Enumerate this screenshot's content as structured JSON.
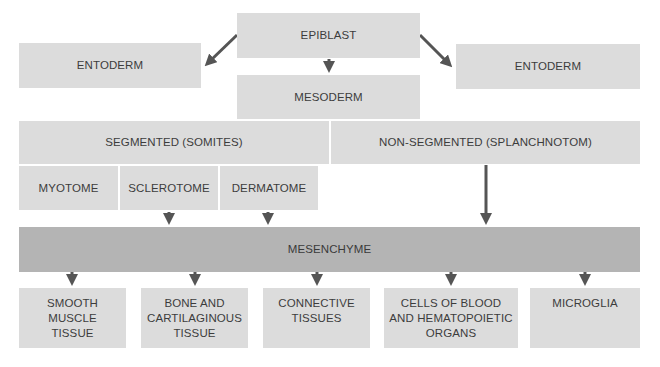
{
  "diagram": {
    "epiblast": "EPIBLAST",
    "entoderm_left": "ENTODERM",
    "entoderm_right": "ENTODERM",
    "mesoderm": "MESODERM",
    "segmented": "SEGMENTED (SOMITES)",
    "non_segmented": "NON-SEGMENTED (SPLANCHNOTOM)",
    "myotome": "MYOTOME",
    "sclerotome": "SCLEROTOME",
    "dermatome": "DERMATOME",
    "mesenchyme": "MESENCHYME",
    "outputs": [
      "SMOOTH\nMUSCLE\nTISSUE",
      "BONE AND\nCARTILAGINOUS\nTISSUE",
      "CONNECTIVE\nTISSUES",
      "CELLS OF BLOOD\nAND HEMATOPOIETIC\nORGANS",
      "MICROGLIA"
    ],
    "colors": {
      "box": "#dcdcdc",
      "mesenchyme": "#b4b4b4",
      "arrow": "#555555",
      "text": "#3c3c3c"
    }
  }
}
